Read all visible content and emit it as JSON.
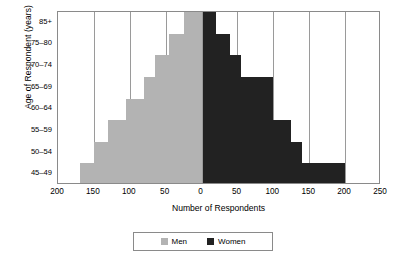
{
  "chart_data": {
    "type": "bar",
    "subtype": "population-pyramid",
    "title": "",
    "xlabel": "Number of Respondents",
    "ylabel": "Age of Respondent (years)",
    "categories": [
      "45–49",
      "50–54",
      "55–59",
      "60–64",
      "65–69",
      "70–74",
      "75–80",
      "85+"
    ],
    "categories_top_to_bottom": [
      "85+",
      "75–80",
      "70–74",
      "65–69",
      "60–64",
      "55–59",
      "50–54",
      "45–49"
    ],
    "series": [
      {
        "name": "Men",
        "color": "#b3b3b3",
        "direction": "left",
        "values": [
          170,
          150,
          130,
          105,
          80,
          65,
          45,
          25
        ]
      },
      {
        "name": "Women",
        "color": "#222222",
        "direction": "right",
        "values": [
          200,
          140,
          125,
          100,
          100,
          55,
          40,
          20
        ]
      }
    ],
    "xlim": [
      -200,
      250
    ],
    "xticks": [
      -200,
      -150,
      -100,
      -50,
      0,
      50,
      100,
      150,
      200,
      250
    ],
    "xtick_labels": [
      "200",
      "150",
      "100",
      "50",
      "0",
      "50",
      "100",
      "150",
      "200",
      "250"
    ],
    "gridlines": [
      -150,
      -100,
      -50,
      0,
      50,
      100,
      150,
      200
    ],
    "grid": true,
    "legend_position": "bottom",
    "legend": [
      {
        "label": "Men",
        "color": "#b3b3b3"
      },
      {
        "label": "Women",
        "color": "#222222"
      }
    ]
  }
}
